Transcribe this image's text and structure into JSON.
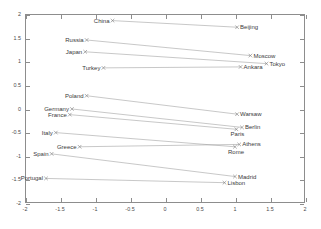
{
  "chart_data": {
    "type": "scatter",
    "title": "",
    "xlabel": "",
    "ylabel": "",
    "xlim": [
      -2,
      2
    ],
    "ylim": [
      -2,
      2
    ],
    "grid": false,
    "legend": null,
    "xticks": [
      "-2",
      "-1.5",
      "-1",
      "-0.5",
      "0",
      "0.5",
      "1",
      "1.5",
      "2"
    ],
    "xtick_values": [
      -2,
      -1.5,
      -1,
      -0.5,
      0,
      0.5,
      1,
      1.5,
      2
    ],
    "yticks": [
      "2",
      "1.5",
      "1",
      "0.5",
      "0",
      "-0.5",
      "-1",
      "-1.5",
      "-2"
    ],
    "ytick_values": [
      2,
      1.5,
      1,
      0.5,
      0,
      -0.5,
      -1,
      -1.5,
      -2
    ],
    "marker": "x",
    "points": [
      {
        "label": "China",
        "x": -0.75,
        "y": 1.86,
        "anchor": "left-of"
      },
      {
        "label": "Beijing",
        "x": 1.03,
        "y": 1.72,
        "anchor": "right-of"
      },
      {
        "label": "Russia",
        "x": -1.12,
        "y": 1.45,
        "anchor": "left-of"
      },
      {
        "label": "Moscow",
        "x": 1.22,
        "y": 1.12,
        "anchor": "right-of"
      },
      {
        "label": "Japan",
        "x": -1.14,
        "y": 1.2,
        "anchor": "left-of"
      },
      {
        "label": "Tokyo",
        "x": 1.45,
        "y": 0.95,
        "anchor": "right-of"
      },
      {
        "label": "Turkey",
        "x": -0.88,
        "y": 0.86,
        "anchor": "left-of"
      },
      {
        "label": "Ankara",
        "x": 1.08,
        "y": 0.88,
        "anchor": "right-of"
      },
      {
        "label": "Poland",
        "x": -1.12,
        "y": 0.27,
        "anchor": "left-of"
      },
      {
        "label": "Warsaw",
        "x": 1.03,
        "y": -0.12,
        "anchor": "right-of"
      },
      {
        "label": "Germany",
        "x": -1.33,
        "y": -0.01,
        "anchor": "left-of"
      },
      {
        "label": "Berlin",
        "x": 1.1,
        "y": -0.4,
        "anchor": "right-of"
      },
      {
        "label": "France",
        "x": -1.36,
        "y": -0.13,
        "anchor": "left-of"
      },
      {
        "label": "Paris",
        "x": 1.02,
        "y": -0.44,
        "anchor": "below"
      },
      {
        "label": "Italy",
        "x": -1.56,
        "y": -0.51,
        "anchor": "left-of"
      },
      {
        "label": "Rome",
        "x": 1.0,
        "y": -0.81,
        "anchor": "below"
      },
      {
        "label": "Greece",
        "x": -1.22,
        "y": -0.81,
        "anchor": "left-of"
      },
      {
        "label": "Athens",
        "x": 1.06,
        "y": -0.76,
        "anchor": "right-of"
      },
      {
        "label": "Spain",
        "x": -1.62,
        "y": -0.96,
        "anchor": "left-of"
      },
      {
        "label": "Madrid",
        "x": 1.0,
        "y": -1.44,
        "anchor": "right-of"
      },
      {
        "label": "Portugal",
        "x": -1.7,
        "y": -1.48,
        "anchor": "left-of"
      },
      {
        "label": "Lisbon",
        "x": 0.85,
        "y": -1.57,
        "anchor": "right-of"
      }
    ],
    "pairs": [
      {
        "from": "China",
        "to": "Beijing"
      },
      {
        "from": "Russia",
        "to": "Moscow"
      },
      {
        "from": "Japan",
        "to": "Tokyo"
      },
      {
        "from": "Turkey",
        "to": "Ankara"
      },
      {
        "from": "Poland",
        "to": "Warsaw"
      },
      {
        "from": "Germany",
        "to": "Berlin"
      },
      {
        "from": "France",
        "to": "Paris"
      },
      {
        "from": "Italy",
        "to": "Rome"
      },
      {
        "from": "Greece",
        "to": "Athens"
      },
      {
        "from": "Spain",
        "to": "Madrid"
      },
      {
        "from": "Portugal",
        "to": "Lisbon"
      }
    ],
    "colors": {
      "axis": "#8d8d8d",
      "line": "#9a9a9a",
      "marker": "#7a7a7a",
      "text": "#3a3a3a",
      "background": "#ffffff"
    }
  }
}
